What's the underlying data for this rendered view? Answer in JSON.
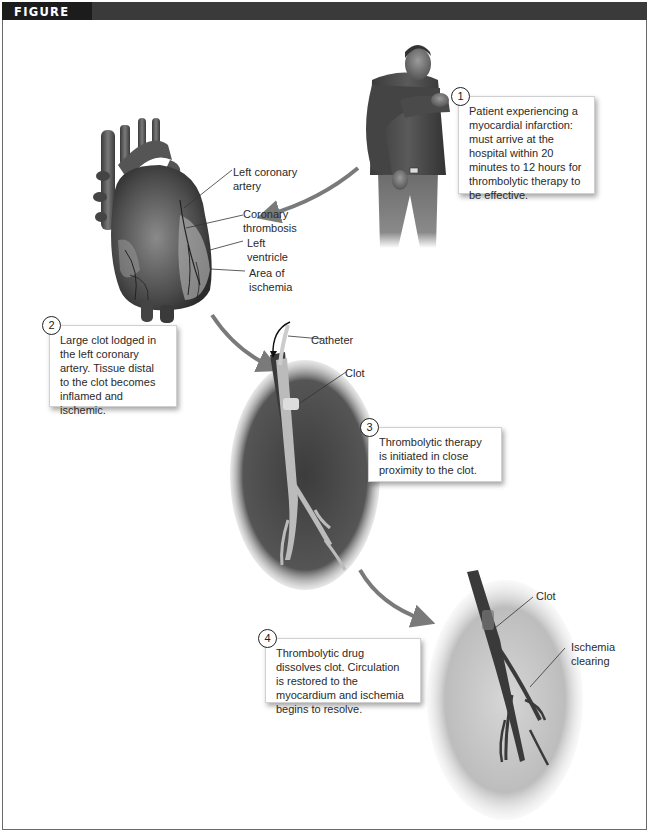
{
  "figure": {
    "title": "FIGURE 20.3"
  },
  "steps": [
    {
      "number": "1",
      "text": "Patient experiencing a myocardial infarction: must arrive at the hospital within 20 minutes to 12 hours for thrombolytic therapy to be effective."
    },
    {
      "number": "2",
      "text": "Large clot lodged in the left coronary artery. Tissue distal to the clot becomes inflamed and ischemic."
    },
    {
      "number": "3",
      "text": "Thrombolytic therapy is initiated in close proximity to the clot."
    },
    {
      "number": "4",
      "text": "Thrombolytic drug dissolves clot. Circulation is restored to the myocardium and ischemia begins to resolve."
    }
  ],
  "heart_labels": {
    "left_coronary_artery": "Left coronary\nartery",
    "coronary_thrombosis": "Coronary\nthrombosis",
    "left_ventricle": "Left\nventricle",
    "area_of_ischemia": "Area of\nischemia"
  },
  "panel3_labels": {
    "catheter": "Catheter",
    "clot": "Clot"
  },
  "panel4_labels": {
    "clot": "Clot",
    "ischemia_clearing": "Ischemia\nclearing"
  },
  "colors": {
    "header_bar": "#3a3a3a",
    "header_tab": "#1c1c1c",
    "arrow": "#7a7a7a",
    "frame_border": "#6a6a6a"
  }
}
